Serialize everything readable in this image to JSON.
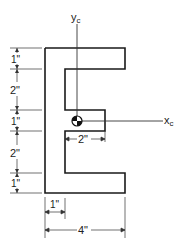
{
  "diagram": {
    "title": "",
    "shape": "E-section (channel with center tongue)",
    "axes": {
      "y_label": "y",
      "y_sub": "c",
      "x_label": "x",
      "x_sub": "c"
    },
    "left_dims": [
      "1\"",
      "2\"",
      "1\"",
      "2\"",
      "1\""
    ],
    "inner_dim": "2\"",
    "bottom_dims": {
      "flange": "1\"",
      "overall": "4\""
    },
    "colors": {
      "line": "#1a1a1a",
      "dim": "#333333",
      "background": "#ffffff"
    }
  }
}
